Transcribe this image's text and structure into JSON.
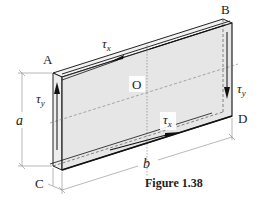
{
  "figure": {
    "caption": "Figure 1.38",
    "corners": {
      "A": "A",
      "B": "B",
      "C": "C",
      "D": "D"
    },
    "center": "O",
    "dimensions": {
      "height": "a",
      "width": "b"
    },
    "stresses": {
      "top": {
        "symbol": "τ",
        "subscript": "x"
      },
      "bottom": {
        "symbol": "τ",
        "subscript": "x"
      },
      "left": {
        "symbol": "τ",
        "subscript": "y"
      },
      "right": {
        "symbol": "τ",
        "subscript": "y"
      }
    },
    "colors": {
      "panel_face": "#e6e6e6",
      "panel_edge": "#f2f2f2",
      "outline": "#222222",
      "dashed": "#555555",
      "dim_line": "#888888"
    }
  }
}
